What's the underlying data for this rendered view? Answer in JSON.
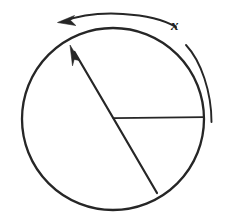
{
  "figure": {
    "background_color": "#ffffff",
    "ink_color": "#262626",
    "width": 230,
    "height": 219,
    "labels": [
      {
        "id": "angle-label",
        "text": "x",
        "style": "italic-serif",
        "x": 173,
        "y": 25,
        "color": "#1f1f1f"
      }
    ],
    "elements": {
      "circle": {
        "name": "main-circle",
        "center_x": 113,
        "center_y": 119,
        "radius": 91,
        "stroke_width": 2.2
      },
      "horizontal_radius": {
        "name": "reference-radius",
        "from_x": 113,
        "from_y": 118,
        "to_x": 204,
        "to_y": 117,
        "stroke_width": 1.7
      },
      "diagonal_radius_arrow": {
        "name": "rotating-radius-arrow",
        "tail_x": 157,
        "tail_y": 193,
        "tip_x": 70,
        "tip_y": 45,
        "stroke_width": 2.1,
        "arrow_at": "tip"
      },
      "rotation_arc_arrow": {
        "name": "counterclockwise-rotation-arrow",
        "start_x": 176,
        "start_y": 27,
        "end_x": 60,
        "end_y": 22,
        "direction": "counterclockwise",
        "stroke_width": 2.0,
        "arrow_at": "end"
      },
      "angle_arc": {
        "name": "angle-measure-arc",
        "start_x": 186,
        "start_y": 45,
        "end_x": 211,
        "end_y": 122,
        "stroke_width": 1.8
      }
    }
  }
}
